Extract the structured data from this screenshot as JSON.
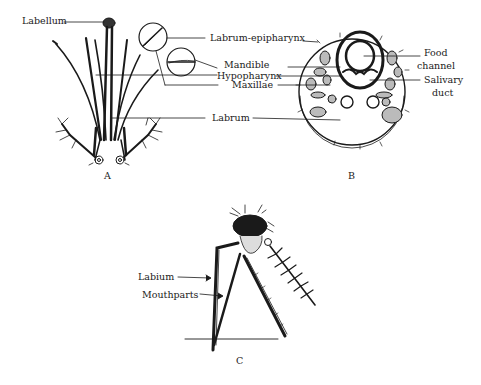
{
  "figure": {
    "panels": [
      {
        "id": "A",
        "label": "A",
        "annotations": {
          "labellum": "Labellum",
          "labrum_epipharynx": "Labrum-epipharynx",
          "mandible": "Mandible",
          "hypopharynx": "Hypopharynx",
          "maxillae": "Maxillae",
          "labrum": "Labrum"
        }
      },
      {
        "id": "B",
        "label": "B",
        "annotations": {
          "food_channel_1": "Food",
          "food_channel_2": "channel",
          "salivary_duct_1": "Salivary",
          "salivary_duct_2": "duct"
        }
      },
      {
        "id": "C",
        "label": "C",
        "annotations": {
          "labium": "Labium",
          "mouthparts": "Mouthparts"
        }
      }
    ],
    "colors": {
      "ink": "#1a1a1a",
      "background": "#ffffff"
    }
  }
}
